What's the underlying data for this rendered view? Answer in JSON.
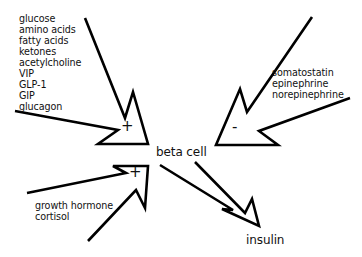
{
  "diagram": {
    "title": "",
    "center_node": {
      "label": "beta cell"
    },
    "output_node": {
      "label": "insulin"
    },
    "stimulators_top": {
      "sign": "+",
      "items": [
        "glucose",
        "amino acids",
        "fatty acids",
        "ketones",
        "acetylcholine",
        "VIP",
        "GLP-1",
        "GIP",
        "glucagon"
      ]
    },
    "inhibitors": {
      "sign": "-",
      "items": [
        "somatostatin",
        "epinephrine",
        "norepinephrine"
      ]
    },
    "stimulators_bottom": {
      "sign": "+",
      "items": [
        "growth hormone",
        "cortisol"
      ]
    },
    "colors": {
      "stroke": "#000000",
      "text": "#111111",
      "background": "#ffffff"
    }
  }
}
